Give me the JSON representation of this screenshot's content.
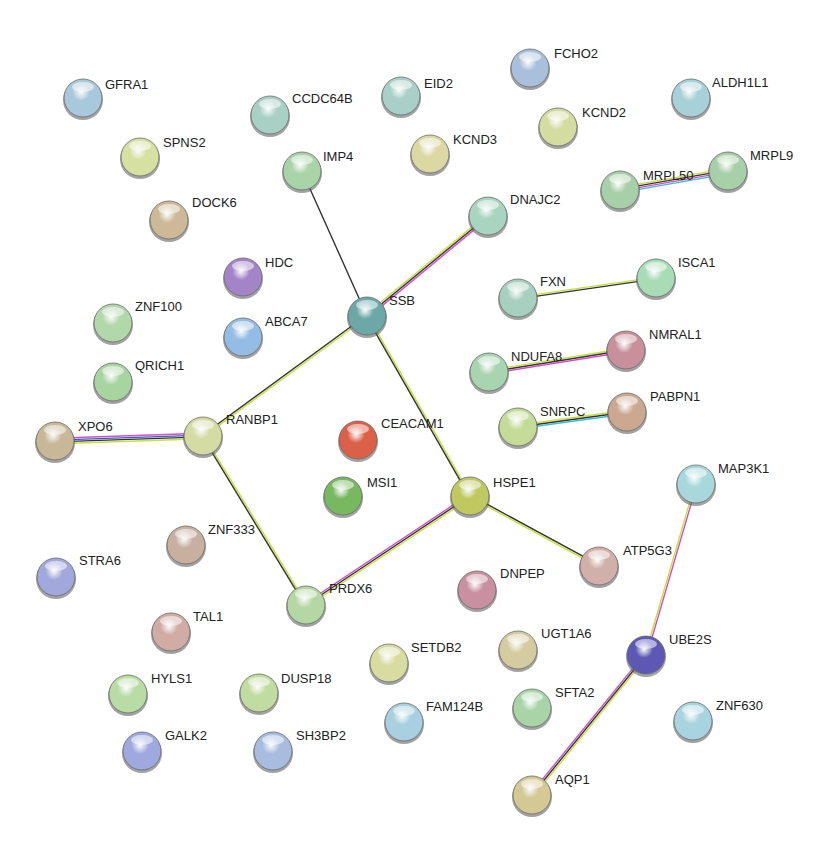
{
  "diagram": {
    "type": "protein-interaction-network",
    "edge_colors": {
      "black": "#333333",
      "yellow": "#c8e03c",
      "magenta": "#d04ec8",
      "cyan": "#40b8e0",
      "blue": "#3a5acc"
    },
    "nodes": [
      {
        "id": "GFRA1",
        "label": "GFRA1",
        "x": 83,
        "y": 98,
        "color": "#a8c8dc",
        "lx": 105,
        "ly": 78
      },
      {
        "id": "SPNS2",
        "label": "SPNS2",
        "x": 140,
        "y": 157,
        "color": "#d6e0a0",
        "lx": 163,
        "ly": 136
      },
      {
        "id": "DOCK6",
        "label": "DOCK6",
        "x": 169,
        "y": 220,
        "color": "#cdb898",
        "lx": 192,
        "ly": 196
      },
      {
        "id": "CCDC64B",
        "label": "CCDC64B",
        "x": 270,
        "y": 115,
        "color": "#a8d0c4",
        "lx": 292,
        "ly": 92
      },
      {
        "id": "EID2",
        "label": "EID2",
        "x": 401,
        "y": 96,
        "color": "#a8d0c8",
        "lx": 424,
        "ly": 77
      },
      {
        "id": "IMP4",
        "label": "IMP4",
        "x": 302,
        "y": 171,
        "color": "#a8d4a8",
        "lx": 323,
        "ly": 150
      },
      {
        "id": "KCND3",
        "label": "KCND3",
        "x": 430,
        "y": 154,
        "color": "#dcd8a4",
        "lx": 453,
        "ly": 133
      },
      {
        "id": "FCHO2",
        "label": "FCHO2",
        "x": 530,
        "y": 68,
        "color": "#a8c0dc",
        "lx": 554,
        "ly": 47
      },
      {
        "id": "KCND2",
        "label": "KCND2",
        "x": 558,
        "y": 127,
        "color": "#d4dca0",
        "lx": 582,
        "ly": 106
      },
      {
        "id": "ALDH1L1",
        "label": "ALDH1L1",
        "x": 691,
        "y": 98,
        "color": "#a8d0d8",
        "lx": 712,
        "ly": 76
      },
      {
        "id": "MRPL50",
        "label": "MRPL50",
        "x": 620,
        "y": 190,
        "color": "#a8d0a8",
        "lx": 643,
        "ly": 169
      },
      {
        "id": "MRPL9",
        "label": "MRPL9",
        "x": 728,
        "y": 171,
        "color": "#a8d0a8",
        "lx": 750,
        "ly": 149
      },
      {
        "id": "DNAJC2",
        "label": "DNAJC2",
        "x": 488,
        "y": 216,
        "color": "#a8d4c0",
        "lx": 510,
        "ly": 193
      },
      {
        "id": "HDC",
        "label": "HDC",
        "x": 243,
        "y": 277,
        "color": "#a484c8",
        "lx": 265,
        "ly": 256
      },
      {
        "id": "ABCA7",
        "label": "ABCA7",
        "x": 243,
        "y": 337,
        "color": "#94bce4",
        "lx": 265,
        "ly": 315
      },
      {
        "id": "SSB",
        "label": "SSB",
        "x": 367,
        "y": 316,
        "color": "#6ca8a8",
        "lx": 389,
        "ly": 294
      },
      {
        "id": "ZNF100",
        "label": "ZNF100",
        "x": 113,
        "y": 323,
        "color": "#b0d8a8",
        "lx": 135,
        "ly": 300
      },
      {
        "id": "QRICH1",
        "label": "QRICH1",
        "x": 113,
        "y": 382,
        "color": "#a8d4a0",
        "lx": 135,
        "ly": 359
      },
      {
        "id": "XPO6",
        "label": "XPO6",
        "x": 55,
        "y": 441,
        "color": "#c8b898",
        "lx": 78,
        "ly": 420
      },
      {
        "id": "RANBP1",
        "label": "RANBP1",
        "x": 203,
        "y": 436,
        "color": "#d4dca4",
        "lx": 226,
        "ly": 413
      },
      {
        "id": "CEACAM1",
        "label": "CEACAM1",
        "x": 358,
        "y": 440,
        "color": "#dc6048",
        "lx": 381,
        "ly": 417
      },
      {
        "id": "MSI1",
        "label": "MSI1",
        "x": 343,
        "y": 496,
        "color": "#78b860",
        "lx": 367,
        "ly": 476
      },
      {
        "id": "HSPE1",
        "label": "HSPE1",
        "x": 470,
        "y": 496,
        "color": "#c0c860",
        "lx": 493,
        "ly": 476
      },
      {
        "id": "FXN",
        "label": "FXN",
        "x": 518,
        "y": 298,
        "color": "#a8d0c0",
        "lx": 540,
        "ly": 275
      },
      {
        "id": "ISCA1",
        "label": "ISCA1",
        "x": 656,
        "y": 278,
        "color": "#a8dcb4",
        "lx": 678,
        "ly": 256
      },
      {
        "id": "NDUFA8",
        "label": "NDUFA8",
        "x": 489,
        "y": 372,
        "color": "#a8d4b0",
        "lx": 511,
        "ly": 350
      },
      {
        "id": "NMRAL1",
        "label": "NMRAL1",
        "x": 626,
        "y": 350,
        "color": "#c8909c",
        "lx": 649,
        "ly": 328
      },
      {
        "id": "SNRPC",
        "label": "SNRPC",
        "x": 518,
        "y": 427,
        "color": "#c4dc98",
        "lx": 540,
        "ly": 405
      },
      {
        "id": "PABPN1",
        "label": "PABPN1",
        "x": 627,
        "y": 412,
        "color": "#cca890",
        "lx": 650,
        "ly": 390
      },
      {
        "id": "MAP3K1",
        "label": "MAP3K1",
        "x": 696,
        "y": 484,
        "color": "#a8d8dc",
        "lx": 718,
        "ly": 462
      },
      {
        "id": "STRA6",
        "label": "STRA6",
        "x": 56,
        "y": 577,
        "color": "#a0a8dc",
        "lx": 79,
        "ly": 554
      },
      {
        "id": "ZNF333",
        "label": "ZNF333",
        "x": 186,
        "y": 545,
        "color": "#c8b0a0",
        "lx": 208,
        "ly": 523
      },
      {
        "id": "ATP5G3",
        "label": "ATP5G3",
        "x": 599,
        "y": 566,
        "color": "#d0b0a8",
        "lx": 623,
        "ly": 544
      },
      {
        "id": "PRDX6",
        "label": "PRDX6",
        "x": 306,
        "y": 605,
        "color": "#b4d8a4",
        "lx": 329,
        "ly": 582
      },
      {
        "id": "DNPEP",
        "label": "DNPEP",
        "x": 477,
        "y": 590,
        "color": "#c890a0",
        "lx": 500,
        "ly": 567
      },
      {
        "id": "TAL1",
        "label": "TAL1",
        "x": 171,
        "y": 632,
        "color": "#d0aca4",
        "lx": 193,
        "ly": 610
      },
      {
        "id": "UGT1A6",
        "label": "UGT1A6",
        "x": 518,
        "y": 650,
        "color": "#d4cca0",
        "lx": 541,
        "ly": 627
      },
      {
        "id": "UBE2S",
        "label": "UBE2S",
        "x": 646,
        "y": 655,
        "color": "#5c58b4",
        "lx": 669,
        "ly": 633
      },
      {
        "id": "SETDB2",
        "label": "SETDB2",
        "x": 389,
        "y": 663,
        "color": "#d8dca0",
        "lx": 411,
        "ly": 641
      },
      {
        "id": "HYLS1",
        "label": "HYLS1",
        "x": 128,
        "y": 694,
        "color": "#b8dca4",
        "lx": 151,
        "ly": 672
      },
      {
        "id": "DUSP18",
        "label": "DUSP18",
        "x": 259,
        "y": 693,
        "color": "#c0dca0",
        "lx": 281,
        "ly": 672
      },
      {
        "id": "FAM124B",
        "label": "FAM124B",
        "x": 404,
        "y": 722,
        "color": "#a8d0e0",
        "lx": 426,
        "ly": 700
      },
      {
        "id": "SFTA2",
        "label": "SFTA2",
        "x": 532,
        "y": 708,
        "color": "#a8d4a8",
        "lx": 555,
        "ly": 686
      },
      {
        "id": "ZNF630",
        "label": "ZNF630",
        "x": 693,
        "y": 721,
        "color": "#a8d4e0",
        "lx": 716,
        "ly": 699
      },
      {
        "id": "GALK2",
        "label": "GALK2",
        "x": 142,
        "y": 751,
        "color": "#a0a8e0",
        "lx": 165,
        "ly": 729
      },
      {
        "id": "SH3BP2",
        "label": "SH3BP2",
        "x": 273,
        "y": 751,
        "color": "#a8bce0",
        "lx": 296,
        "ly": 729
      },
      {
        "id": "AQP1",
        "label": "AQP1",
        "x": 532,
        "y": 795,
        "color": "#d4c894",
        "lx": 555,
        "ly": 773
      }
    ],
    "edges": [
      {
        "source": "IMP4",
        "target": "SSB",
        "colors": [
          "#333333"
        ]
      },
      {
        "source": "SSB",
        "target": "DNAJC2",
        "colors": [
          "#c8e03c",
          "#333333",
          "#d04ec8"
        ]
      },
      {
        "source": "SSB",
        "target": "RANBP1",
        "colors": [
          "#c8e03c",
          "#333333"
        ]
      },
      {
        "source": "SSB",
        "target": "HSPE1",
        "colors": [
          "#c8e03c",
          "#333333"
        ]
      },
      {
        "source": "MRPL50",
        "target": "MRPL9",
        "colors": [
          "#c8e03c",
          "#333333",
          "#d04ec8",
          "#40b8e0"
        ]
      },
      {
        "source": "FXN",
        "target": "ISCA1",
        "colors": [
          "#c8e03c",
          "#333333"
        ]
      },
      {
        "source": "NDUFA8",
        "target": "NMRAL1",
        "colors": [
          "#c8e03c",
          "#333333",
          "#d04ec8"
        ]
      },
      {
        "source": "SNRPC",
        "target": "PABPN1",
        "colors": [
          "#c8e03c",
          "#333333",
          "#40b8e0"
        ]
      },
      {
        "source": "XPO6",
        "target": "RANBP1",
        "colors": [
          "#d04ec8",
          "#3a5acc",
          "#333333",
          "#c8e03c"
        ]
      },
      {
        "source": "RANBP1",
        "target": "PRDX6",
        "colors": [
          "#c8e03c",
          "#333333"
        ]
      },
      {
        "source": "HSPE1",
        "target": "PRDX6",
        "colors": [
          "#c8e03c",
          "#333333",
          "#d04ec8"
        ]
      },
      {
        "source": "HSPE1",
        "target": "ATP5G3",
        "colors": [
          "#333333",
          "#c8e03c"
        ]
      },
      {
        "source": "MAP3K1",
        "target": "UBE2S",
        "colors": [
          "#d04ec8",
          "#c8e03c"
        ]
      },
      {
        "source": "UBE2S",
        "target": "AQP1",
        "colors": [
          "#c8e03c",
          "#333333",
          "#d04ec8"
        ]
      }
    ]
  }
}
